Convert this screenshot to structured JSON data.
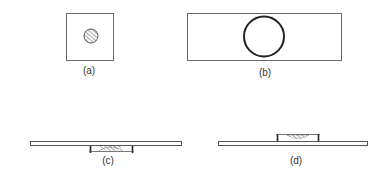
{
  "colors": {
    "background": "#ffffff",
    "stroke": "#4a4a4a",
    "stroke_dark": "#222222",
    "hatch": "#555555"
  },
  "panels": [
    {
      "id": "a",
      "label": "(a)",
      "description": "Small square slide viewed from above with a small hatched circular specimen in the center"
    },
    {
      "id": "b",
      "label": "(b)",
      "description": "Wide rectangular slide viewed from above with a large open circle in the center"
    },
    {
      "id": "c",
      "label": "(c)",
      "description": "Side view: long slide with two supports beneath it and a hanging-drop dome between the supports"
    },
    {
      "id": "d",
      "label": "(d)",
      "description": "Side view: long slide with two supports on top and a hatched dome between the supports"
    }
  ]
}
